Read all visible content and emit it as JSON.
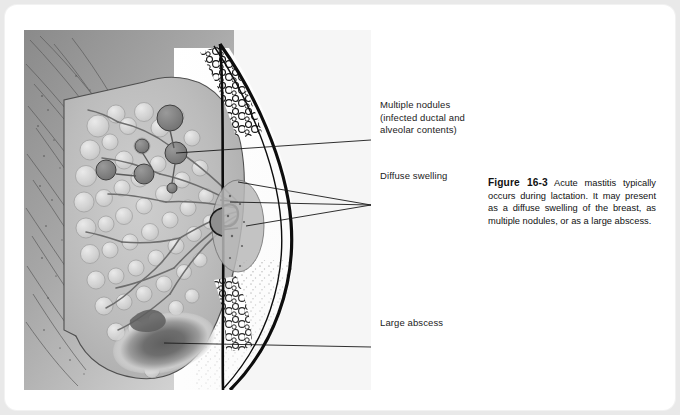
{
  "figure": {
    "number": "Figure 16-3",
    "caption_body": "Acute mastitis typically occurs during lactation. It may present as a diffuse swelling of the breast, as multiple nodules, or as a large abscess."
  },
  "callouts": [
    {
      "id": "multiple-nodules",
      "text": "Multiple nodules\n(infected ductal and\nalveolar contents)"
    },
    {
      "id": "diffuse-swelling",
      "text": "Diffuse swelling"
    },
    {
      "id": "large-abscess",
      "text": "Large abscess"
    }
  ],
  "illustration": {
    "alt": "Sagittal cross-section of a lactating breast showing acute mastitis",
    "colors": {
      "chest_wall_dark": "#8d8d8d",
      "chest_wall_light": "#cfcfcf",
      "glandular_tissue": "#b5b5b5",
      "lobule_light": "#d8d8d8",
      "nodule_dark": "#7a7a7a",
      "abscess_core": "#6a6a6a",
      "skin_outline": "#111111",
      "panel_background": "#f5f5f5",
      "page_background": "#e9e9e9",
      "card_background": "#ffffff",
      "text": "#1b1b1b"
    }
  }
}
